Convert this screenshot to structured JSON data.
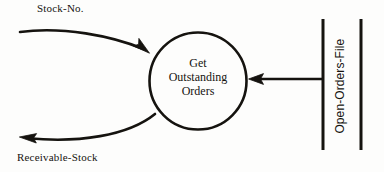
{
  "diagram": {
    "type": "data-flow-diagram",
    "background_color": "#fdfdfc",
    "ink_color": "#15130f",
    "process": {
      "shape": "circle",
      "center": [
        198,
        81
      ],
      "radius": 49,
      "lines": [
        "Get",
        "Outstanding",
        "Orders"
      ],
      "text": "Get Outstanding Orders"
    },
    "flows": [
      {
        "name": "stock-no-flow",
        "label": "Stock-No.",
        "direction": "into-process",
        "style": "curved",
        "from": [
          20,
          32
        ],
        "to": [
          148,
          52
        ]
      },
      {
        "name": "receivable-stock-flow",
        "label": "Receivable-Stock",
        "direction": "out-of-process",
        "style": "curved",
        "from": [
          154,
          113
        ],
        "to": [
          20,
          138
        ]
      },
      {
        "name": "open-orders-file-flow",
        "label": "",
        "direction": "into-process",
        "style": "straight",
        "from": [
          323,
          79
        ],
        "to": [
          249,
          79
        ]
      }
    ],
    "data_store": {
      "name": "open-orders-file",
      "label": "Open-Orders-File",
      "orientation": "vertical",
      "text_rotation_deg": -90,
      "left_line_x": 323,
      "right_line_x": 361,
      "top_y": 19,
      "bottom_y": 150
    }
  }
}
